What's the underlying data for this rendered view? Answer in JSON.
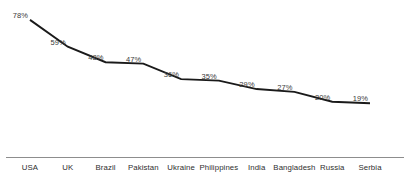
{
  "chart_data": {
    "type": "line",
    "title": "",
    "subtitle": "",
    "xlabel": "",
    "ylabel": "",
    "ylim": [
      0,
      85
    ],
    "grid": false,
    "legend": false,
    "legend_position": "none",
    "line_color": "#1a1a1a",
    "label_color": "#3a3a3a",
    "axis_color": "#8d8d8d",
    "categories": [
      "USA",
      "UK",
      "Brazil",
      "Pakistan",
      "Ukraine",
      "Philippines",
      "India",
      "Bangladesh",
      "Russia",
      "Serbia"
    ],
    "values": [
      78,
      59,
      48,
      47,
      36,
      35,
      29,
      27,
      20,
      19
    ],
    "point_labels": [
      "78%",
      "59%",
      "48%",
      "47%",
      "36%",
      "35%",
      "29%",
      "27%",
      "20%",
      "19%"
    ]
  }
}
